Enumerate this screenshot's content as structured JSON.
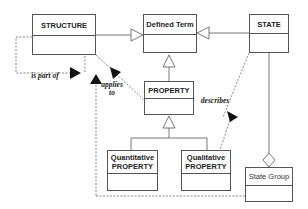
{
  "diagram": {
    "type": "uml-class-diagram",
    "classes": {
      "structure": {
        "name": "STRUCTURE"
      },
      "defined_term": {
        "name": "Defined Term"
      },
      "state": {
        "name": "STATE"
      },
      "property": {
        "name": "PROPERTY"
      },
      "quantitative_property": {
        "name_line1": "Quantitative",
        "name_line2": "PROPERTY"
      },
      "qualitative_property": {
        "name_line1": "Qualitative",
        "name_line2": "PROPERTY"
      },
      "state_group": {
        "name": "State Group"
      }
    },
    "relations": {
      "is_part_of": {
        "label": "is part of",
        "from": "STRUCTURE",
        "to": "STRUCTURE"
      },
      "applies_to": {
        "label_line1": "applies",
        "label_line2": "to",
        "from": "PROPERTY",
        "to": "STRUCTURE"
      },
      "describes": {
        "label": "describes",
        "from": "STATE",
        "to": "Qualitative PROPERTY"
      },
      "generalizations": [
        {
          "from": "STRUCTURE",
          "to": "Defined Term"
        },
        {
          "from": "STATE",
          "to": "Defined Term"
        },
        {
          "from": "PROPERTY",
          "to": "Defined Term"
        },
        {
          "from": "Quantitative PROPERTY",
          "to": "PROPERTY"
        },
        {
          "from": "Qualitative PROPERTY",
          "to": "PROPERTY"
        }
      ],
      "aggregation": {
        "whole": "State Group",
        "part": "STATE"
      }
    },
    "colors": {
      "line": "#555555",
      "text": "#222222",
      "background": "#ffffff"
    }
  }
}
